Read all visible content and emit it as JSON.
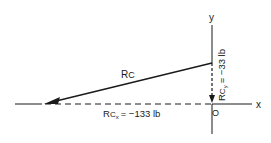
{
  "diagram": {
    "axes": {
      "x_label": "x",
      "y_label": "y",
      "origin_label": "O"
    },
    "vector": {
      "label_main": "R",
      "label_sub": "C"
    },
    "components": {
      "x": {
        "label_main": "R",
        "label_sub": "C",
        "label_subsub": "x",
        "value": "= −133 lb"
      },
      "y": {
        "label_main": "R",
        "label_sub": "C",
        "label_subsub": "y",
        "value": "= −33 lb"
      }
    },
    "colors": {
      "ink": "#1a1a1a",
      "background": "#ffffff"
    }
  }
}
